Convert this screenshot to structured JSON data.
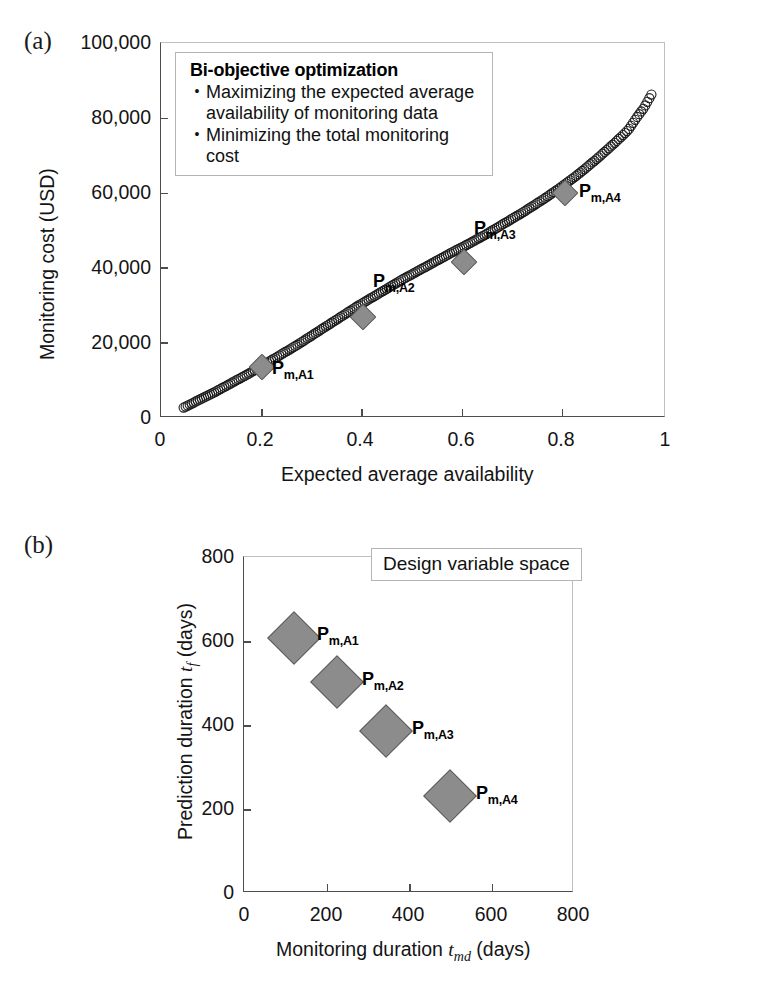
{
  "figure": {
    "panel_a_tag": "(a)",
    "panel_b_tag": "(b)"
  },
  "panel_a": {
    "legend": {
      "title": "Bi-objective optimization",
      "bullet_glyph": "•",
      "items": [
        "Maximizing the expected average availability of monitoring data",
        "Minimizing the total monitoring cost"
      ]
    },
    "ylabel": "Monitoring cost (USD)",
    "xlabel": "Expected average availability",
    "yticks": [
      "0",
      "20,000",
      "40,000",
      "60,000",
      "80,000",
      "100,000"
    ],
    "xticks": [
      "0",
      "0.2",
      "0.4",
      "0.6",
      "0.8",
      "1"
    ],
    "point_labels": [
      {
        "base": "P",
        "sub": "m,A1"
      },
      {
        "base": "P",
        "sub": "m,A2"
      },
      {
        "base": "P",
        "sub": "m,A3"
      },
      {
        "base": "P",
        "sub": "m,A4"
      }
    ]
  },
  "panel_b": {
    "box_label": "Design variable space",
    "ylabel_pre": "Prediction duration ",
    "ylabel_var": "t",
    "ylabel_var_sub": "f",
    "ylabel_post": " (days)",
    "xlabel_pre": "Monitoring duration ",
    "xlabel_var": "t",
    "xlabel_var_sub": "md",
    "xlabel_post": " (days)",
    "yticks": [
      "0",
      "200",
      "400",
      "600",
      "800"
    ],
    "xticks": [
      "0",
      "200",
      "400",
      "600",
      "800"
    ],
    "point_labels": [
      {
        "base": "P",
        "sub": "m,A1"
      },
      {
        "base": "P",
        "sub": "m,A2"
      },
      {
        "base": "P",
        "sub": "m,A3"
      },
      {
        "base": "P",
        "sub": "m,A4"
      }
    ]
  },
  "colors": {
    "marker_fill": "#8c8c8c",
    "marker_edge": "#585858",
    "curve": "#1a1a1a",
    "axis": "#4d4d4d",
    "text": "#111111"
  },
  "chart_data": [
    {
      "type": "scatter",
      "id": "panel-a-pareto-front",
      "title": "",
      "xlabel": "Expected average availability",
      "ylabel": "Monitoring cost (USD)",
      "xlim": [
        0,
        1
      ],
      "ylim": [
        0,
        100000
      ],
      "xticks": [
        0,
        0.2,
        0.4,
        0.6,
        0.8,
        1
      ],
      "yticks": [
        0,
        20000,
        40000,
        60000,
        80000,
        100000
      ],
      "grid": false,
      "legend_position": "top-left",
      "series": [
        {
          "name": "Pareto front (dense solution points)",
          "marker": "circle-outline",
          "x": [
            0.045,
            0.06,
            0.075,
            0.09,
            0.105,
            0.12,
            0.135,
            0.15,
            0.165,
            0.18,
            0.195,
            0.21,
            0.225,
            0.24,
            0.255,
            0.27,
            0.285,
            0.3,
            0.315,
            0.33,
            0.345,
            0.36,
            0.375,
            0.39,
            0.405,
            0.42,
            0.435,
            0.45,
            0.465,
            0.48,
            0.495,
            0.51,
            0.525,
            0.54,
            0.555,
            0.57,
            0.585,
            0.6,
            0.615,
            0.63,
            0.645,
            0.66,
            0.675,
            0.69,
            0.705,
            0.72,
            0.735,
            0.75,
            0.765,
            0.78,
            0.795,
            0.81,
            0.825,
            0.84,
            0.855,
            0.87,
            0.885,
            0.9,
            0.915,
            0.93,
            0.945,
            0.96,
            0.975
          ],
          "y": [
            2400,
            3400,
            4400,
            5400,
            6400,
            7500,
            8600,
            9700,
            10800,
            11900,
            13100,
            14300,
            15500,
            16700,
            17900,
            19100,
            20400,
            21700,
            23000,
            24300,
            25600,
            26900,
            28200,
            29500,
            30700,
            31900,
            33100,
            34300,
            35500,
            36700,
            37800,
            38900,
            40000,
            41100,
            42200,
            43300,
            44400,
            45400,
            46500,
            47600,
            48700,
            49900,
            51100,
            52300,
            53500,
            54700,
            56000,
            57300,
            58600,
            60000,
            61400,
            62900,
            64400,
            66000,
            67700,
            69400,
            71200,
            73000,
            74900,
            76900,
            79900,
            82600,
            86200
          ]
        },
        {
          "name": "Selected designs",
          "marker": "diamond",
          "x": [
            0.2,
            0.4,
            0.6,
            0.8
          ],
          "y": [
            13500,
            27000,
            41500,
            60000
          ],
          "labels": [
            "P m,A1",
            "P m,A2",
            "P m,A3",
            "P m,A4"
          ]
        }
      ]
    },
    {
      "type": "scatter",
      "id": "panel-b-design-variable-space",
      "title": "Design variable space",
      "xlabel": "Monitoring duration t_md (days)",
      "ylabel": "Prediction duration t_f (days)",
      "xlim": [
        0,
        800
      ],
      "ylim": [
        0,
        800
      ],
      "xticks": [
        0,
        200,
        400,
        600,
        800
      ],
      "yticks": [
        0,
        200,
        400,
        600,
        800
      ],
      "grid": false,
      "legend_position": "top-right",
      "series": [
        {
          "name": "Selected designs",
          "marker": "diamond",
          "x": [
            120,
            225,
            345,
            500
          ],
          "y": [
            608,
            502,
            385,
            232
          ],
          "labels": [
            "P m,A1",
            "P m,A2",
            "P m,A3",
            "P m,A4"
          ]
        }
      ]
    }
  ]
}
